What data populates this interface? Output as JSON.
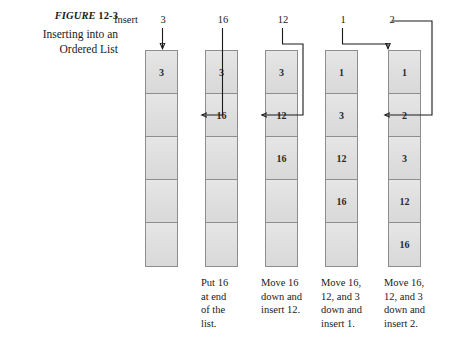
{
  "figure": {
    "label_word": "FIGURE",
    "label_number": "12-3",
    "title_line1": "Inserting into an",
    "title_line2": "Ordered List"
  },
  "header": {
    "insert_label": "Insert",
    "inserted_values": [
      "3",
      "16",
      "12",
      "1",
      "2"
    ]
  },
  "colors": {
    "cell_fill": "#e0e0e0",
    "cell_border": "#8d8d8d",
    "line": "#1a1a1a",
    "text": "#1a1a1a",
    "background": "#ffffff"
  },
  "columns": [
    {
      "index": 1,
      "inserted": "3",
      "cells": [
        "3",
        "",
        "",
        "",
        ""
      ],
      "caption": ""
    },
    {
      "index": 2,
      "inserted": "16",
      "cells": [
        "3",
        "16",
        "",
        "",
        ""
      ],
      "caption": "Put 16 at end of the list."
    },
    {
      "index": 3,
      "inserted": "12",
      "cells": [
        "3",
        "12",
        "16",
        "",
        ""
      ],
      "caption": "Move 16 down and insert 12."
    },
    {
      "index": 4,
      "inserted": "1",
      "cells": [
        "1",
        "3",
        "12",
        "16",
        ""
      ],
      "caption": "Move 16, 12, and 3 down and insert 1."
    },
    {
      "index": 5,
      "inserted": "2",
      "cells": [
        "1",
        "2",
        "3",
        "12",
        "16"
      ],
      "caption": "Move 16, 12, and 3 down and insert 2."
    }
  ],
  "captions": {
    "col2": [
      "Put 16",
      "at end",
      "of the",
      "list."
    ],
    "col3": [
      "Move 16",
      "down and",
      "insert 12."
    ],
    "col4": [
      "Move 16,",
      "12, and 3",
      "down and",
      "insert 1."
    ],
    "col5": [
      "Move 16,",
      "12, and 3",
      "down and",
      "insert 2."
    ]
  }
}
